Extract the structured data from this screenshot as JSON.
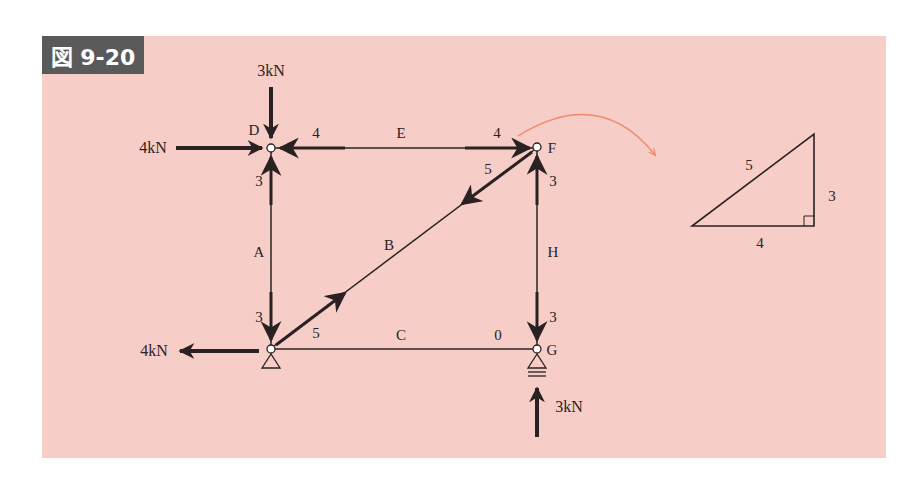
{
  "figure": {
    "label": "図 9-20",
    "background_color": "#f6cdc7",
    "badge_color": "#5b5a5a",
    "line_color": "#2a2222",
    "curve_arrow_color": "#f08a6a"
  },
  "nodes": {
    "D": {
      "label": "D",
      "x": 271,
      "y": 148
    },
    "F": {
      "label": "F",
      "x": 537,
      "y": 147
    },
    "G": {
      "label": "G",
      "x": 537,
      "y": 349
    },
    "bottom_left": {
      "label": "",
      "x": 271,
      "y": 349
    }
  },
  "members": {
    "A": {
      "label": "A",
      "end_force_top": "3",
      "end_force_bottom": "3"
    },
    "B": {
      "label": "B",
      "end_force_top": "5",
      "end_force_bottom": "5"
    },
    "C": {
      "label": "C",
      "end_force_right": "0"
    },
    "E": {
      "label": "E",
      "end_force_left": "4",
      "end_force_right": "4"
    },
    "H": {
      "label": "H",
      "end_force_top": "3",
      "end_force_bottom": "3"
    }
  },
  "loads": {
    "top_D": "3kN",
    "left_D": "4kN",
    "left_bottom": "4kN",
    "bottom_G": "3kN"
  },
  "triangle": {
    "hypotenuse": "5",
    "vertical": "3",
    "horizontal": "4"
  }
}
